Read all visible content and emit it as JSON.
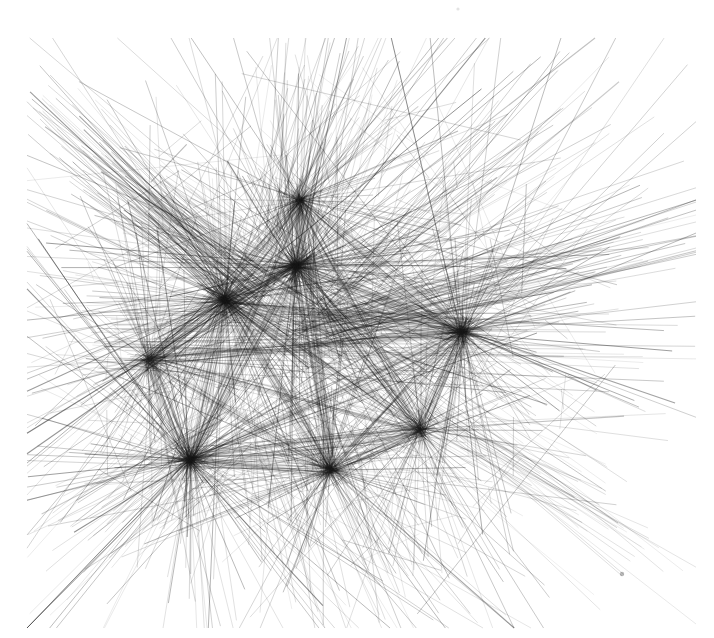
{
  "artwork": {
    "title": "Untitled Line Convergence",
    "medium": "generative straight-line segments",
    "canvas": {
      "width": 714,
      "height": 638,
      "background": "#ffffff"
    },
    "stroke": {
      "color": "#1a1a1a",
      "min_width": 0.35,
      "max_width": 1.15,
      "min_opacity": 0.1,
      "max_opacity": 0.72,
      "linecap": "butt"
    },
    "composition": {
      "ink_bounds": {
        "x_min": 33,
        "y_min": 44,
        "x_max": 690,
        "y_max": 622
      },
      "densest_region": {
        "x": 150,
        "y": 180,
        "width": 360,
        "height": 300
      },
      "overall_tone": "light gray mass with near-black nodal knots",
      "negative_space": [
        "top-right corner",
        "bottom-right corner",
        "bottom-left corner",
        "top-left corner"
      ]
    },
    "total_segments": 1150,
    "random_seed": 20240917,
    "hubs": [
      {
        "name": "hub-central-upper",
        "x": 296,
        "y": 266,
        "weight": 150,
        "spread": 360,
        "reach_min": 60,
        "reach_max": 330,
        "darkness": 0.62
      },
      {
        "name": "hub-central-left",
        "x": 225,
        "y": 300,
        "weight": 165,
        "spread": 360,
        "reach_min": 70,
        "reach_max": 360,
        "darkness": 0.6
      },
      {
        "name": "hub-lower-left",
        "x": 190,
        "y": 460,
        "weight": 145,
        "spread": 360,
        "reach_min": 60,
        "reach_max": 340,
        "darkness": 0.58
      },
      {
        "name": "hub-right-mid",
        "x": 462,
        "y": 332,
        "weight": 140,
        "spread": 360,
        "reach_min": 70,
        "reach_max": 330,
        "darkness": 0.58
      },
      {
        "name": "hub-lower-center",
        "x": 330,
        "y": 470,
        "weight": 110,
        "spread": 360,
        "reach_min": 55,
        "reach_max": 300,
        "darkness": 0.5
      },
      {
        "name": "hub-upper-mid",
        "x": 300,
        "y": 200,
        "weight": 95,
        "spread": 360,
        "reach_min": 50,
        "reach_max": 260,
        "darkness": 0.46
      },
      {
        "name": "hub-left-mid",
        "x": 150,
        "y": 360,
        "weight": 90,
        "spread": 360,
        "reach_min": 50,
        "reach_max": 270,
        "darkness": 0.44
      },
      {
        "name": "hub-right-lower",
        "x": 420,
        "y": 430,
        "weight": 85,
        "spread": 360,
        "reach_min": 50,
        "reach_max": 260,
        "darkness": 0.44
      }
    ],
    "bundles": [
      {
        "name": "bundle-upper-left-rays",
        "origin_x": 250,
        "origin_y": 290,
        "target_x": 62,
        "target_y": 132,
        "count": 70,
        "jitter_angle": 9,
        "jitter_target": 46,
        "darkness": 0.44
      },
      {
        "name": "bundle-right-convergence",
        "origin_x": 300,
        "origin_y": 330,
        "target_x": 672,
        "target_y": 232,
        "count": 62,
        "jitter_angle": 7,
        "jitter_target": 40,
        "darkness": 0.46
      },
      {
        "name": "bundle-upper-right-fan",
        "origin_x": 340,
        "origin_y": 300,
        "target_x": 560,
        "target_y": 110,
        "count": 46,
        "jitter_angle": 13,
        "jitter_target": 60,
        "darkness": 0.34
      },
      {
        "name": "bundle-top-spray",
        "origin_x": 290,
        "origin_y": 250,
        "target_x": 330,
        "target_y": 58,
        "count": 52,
        "jitter_angle": 20,
        "jitter_target": 110,
        "darkness": 0.32
      },
      {
        "name": "bundle-bottom-spray",
        "origin_x": 300,
        "origin_y": 430,
        "target_x": 360,
        "target_y": 612,
        "count": 58,
        "jitter_angle": 20,
        "jitter_target": 120,
        "darkness": 0.34
      },
      {
        "name": "bundle-lower-left-rays",
        "origin_x": 220,
        "origin_y": 430,
        "target_x": 68,
        "target_y": 545,
        "count": 40,
        "jitter_angle": 14,
        "jitter_target": 60,
        "darkness": 0.34
      },
      {
        "name": "bundle-diagonal-sweep",
        "origin_x": 150,
        "origin_y": 200,
        "target_x": 520,
        "target_y": 470,
        "count": 44,
        "jitter_angle": 5,
        "jitter_target": 52,
        "darkness": 0.4
      },
      {
        "name": "bundle-horizontal-band",
        "origin_x": 110,
        "origin_y": 330,
        "target_x": 600,
        "target_y": 348,
        "count": 36,
        "jitter_angle": 4,
        "jitter_target": 44,
        "darkness": 0.3
      },
      {
        "name": "bundle-lower-right-rays",
        "origin_x": 430,
        "origin_y": 420,
        "target_x": 636,
        "target_y": 560,
        "count": 34,
        "jitter_angle": 12,
        "jitter_target": 58,
        "darkness": 0.26
      }
    ],
    "stray_marks": [
      {
        "name": "speck-top",
        "x": 458,
        "y": 9,
        "r": 1.6,
        "opacity": 0.12
      },
      {
        "name": "dot-bottom-right",
        "x": 622,
        "y": 574,
        "r": 2.2,
        "opacity": 0.3
      }
    ],
    "scatter": {
      "count": 230,
      "center_x": 330,
      "center_y": 330,
      "radius_x": 270,
      "radius_y": 235,
      "len_min": 30,
      "len_max": 260,
      "darkness": 0.3
    }
  },
  "meta": {
    "label_visible": false
  }
}
